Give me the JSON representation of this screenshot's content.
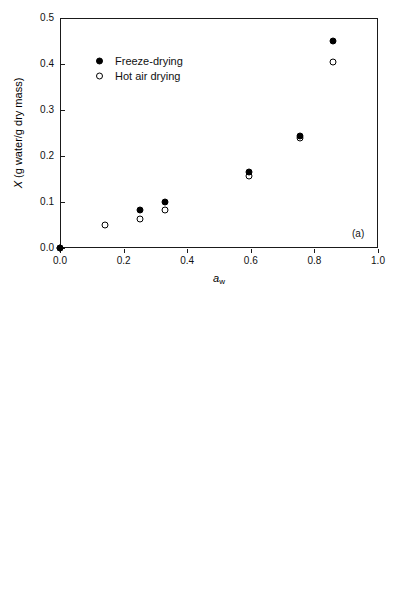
{
  "figure": {
    "background": "#ffffff",
    "marker_color": "#000000",
    "axis_color": "#1a1a1a"
  },
  "chart_data": [
    {
      "type": "scatter",
      "panel": "(a)",
      "title": "",
      "xlabel": "a_w",
      "ylabel": "X (g water/g dry mass)",
      "xlim": [
        0.0,
        1.0
      ],
      "ylim": [
        0.0,
        0.5
      ],
      "xticks": [
        "0.0",
        "0.2",
        "0.4",
        "0.6",
        "0.8",
        "1.0"
      ],
      "xtick_values": [
        0.0,
        0.2,
        0.4,
        0.6,
        0.8,
        1.0
      ],
      "yticks": [
        "0.0",
        "0.1",
        "0.2",
        "0.3",
        "0.4",
        "0.5"
      ],
      "ytick_values": [
        0.0,
        0.1,
        0.2,
        0.3,
        0.4,
        0.5
      ],
      "grid": false,
      "legend_position": "upper left",
      "series": [
        {
          "name": "Freeze-drying",
          "marker": "filled-circle",
          "x": [
            0.0,
            0.25,
            0.33,
            0.595,
            0.755,
            0.86
          ],
          "y": [
            0.0,
            0.082,
            0.101,
            0.165,
            0.244,
            0.45
          ]
        },
        {
          "name": "Hot air drying",
          "marker": "open-circle",
          "x": [
            0.0,
            0.14,
            0.25,
            0.33,
            0.595,
            0.755,
            0.86
          ],
          "y": [
            0.0,
            0.049,
            0.062,
            0.082,
            0.157,
            0.24,
            0.404
          ]
        }
      ]
    },
    {
      "type": "scatter",
      "panel": "(b)",
      "title": "",
      "xlabel": "a_w",
      "ylabel": "X (g water/g dry mass)",
      "xlim": [
        0.0,
        0.8
      ],
      "ylim": [
        0.0,
        0.35
      ],
      "xticks": [
        "0.0",
        "0.2",
        "0.4",
        "0.6",
        "0.8"
      ],
      "xtick_values": [
        0.0,
        0.2,
        0.4,
        0.6,
        0.8
      ],
      "yticks": [
        "0.00",
        "0.05",
        "0.10",
        "0.15",
        "0.20",
        "0.25",
        "0.30",
        "0.35"
      ],
      "ytick_values": [
        0.0,
        0.05,
        0.1,
        0.15,
        0.2,
        0.25,
        0.3,
        0.35
      ],
      "grid": false,
      "legend_position": "upper left",
      "series": [
        {
          "name": "Freeze-drying",
          "marker": "filled-circle",
          "x": [
            0.0,
            0.11,
            0.32,
            0.43,
            0.49,
            0.66,
            0.75
          ],
          "y": [
            0.0,
            0.08,
            0.1,
            0.11,
            0.14,
            0.26,
            0.31
          ]
        },
        {
          "name": "Hot air drying",
          "marker": "open-circle",
          "x": [
            0.0,
            0.11,
            0.32,
            0.43,
            0.49,
            0.66,
            0.75
          ],
          "y": [
            0.0,
            0.05,
            0.08,
            0.09,
            0.11,
            0.23,
            0.28
          ]
        }
      ]
    }
  ],
  "axis_titles": {
    "x_main": "a",
    "x_sub": "w",
    "y_main": "X",
    "y_rest": " (g water/g dry mass)"
  },
  "legend": {
    "entries": [
      {
        "label": "Freeze-drying",
        "marker": "filled-circle"
      },
      {
        "label": "Hot air drying",
        "marker": "open-circle"
      }
    ]
  },
  "panel_labels": {
    "a": "(a)",
    "b": "(b)"
  }
}
